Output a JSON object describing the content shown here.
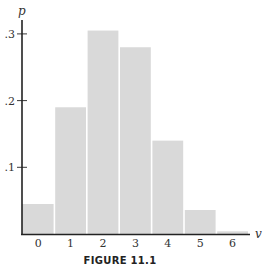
{
  "chart_data": {
    "type": "bar",
    "title": "",
    "caption": "FIGURE 11.1",
    "xlabel": "v",
    "ylabel": "p",
    "categories": [
      "0",
      "1",
      "2",
      "3",
      "4",
      "5",
      "6"
    ],
    "values": [
      0.045,
      0.19,
      0.305,
      0.28,
      0.14,
      0.036,
      0.004
    ],
    "yticks": [
      ".1",
      ".2",
      ".3"
    ],
    "ytick_values": [
      0.1,
      0.2,
      0.3
    ],
    "ylim": [
      0,
      0.32
    ],
    "grid": false,
    "legend": null,
    "bar_color": "#d9d9d9",
    "axis_color": "#222222"
  }
}
